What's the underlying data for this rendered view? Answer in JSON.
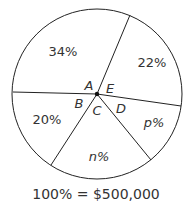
{
  "diagram": {
    "type": "pie",
    "sectors": [
      {
        "label": "34%",
        "angle_label": "A"
      },
      {
        "label": "22%",
        "angle_label": "E"
      },
      {
        "label": "p%",
        "angle_label": "D"
      },
      {
        "label": "n%",
        "angle_label": "C"
      },
      {
        "label": "20%",
        "angle_label": "B"
      }
    ],
    "caption": "100% = $500,000"
  },
  "colors": {
    "stroke": "#222222",
    "text": "#333333",
    "background": "#ffffff"
  }
}
